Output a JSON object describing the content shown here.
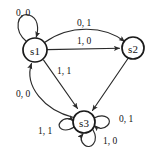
{
  "diagram": {
    "type": "finite-state-machine",
    "colors": {
      "background": "#ffffff",
      "node_stroke": "#1a1a1a",
      "node_fill": "#ffffff",
      "edge_stroke": "#2a2a2a",
      "text": "#121212"
    },
    "nodes": [
      {
        "id": "s1",
        "label": "s1",
        "cx": 35,
        "cy": 50,
        "r": 12
      },
      {
        "id": "s2",
        "label": "s2",
        "cx": 133,
        "cy": 48,
        "r": 11
      },
      {
        "id": "s3",
        "label": "s3",
        "cx": 84,
        "cy": 122,
        "r": 11
      }
    ],
    "edges": [
      {
        "id": "e1",
        "from": "s1",
        "to": "s1",
        "label": "0, 0",
        "kind": "self-loop",
        "lx": 23,
        "ly": 13
      },
      {
        "id": "e2",
        "from": "s1",
        "to": "s2",
        "label": "0, 1",
        "kind": "curved-arc",
        "lx": 84,
        "ly": 23
      },
      {
        "id": "e3",
        "from": "s1",
        "to": "s2",
        "label": "1, 0",
        "kind": "straight",
        "lx": 84,
        "ly": 41
      },
      {
        "id": "e4",
        "from": "s1",
        "to": "s3",
        "label": "1, 1",
        "kind": "straight",
        "lx": 64,
        "ly": 71
      },
      {
        "id": "e5",
        "from": "s3",
        "to": "s1",
        "label": "0, 0",
        "kind": "curved-arc",
        "lx": 23,
        "ly": 94
      },
      {
        "id": "e6",
        "from": "s2",
        "to": "s3",
        "label": "",
        "kind": "straight",
        "lx": 0,
        "ly": 0
      },
      {
        "id": "e7",
        "from": "s3",
        "to": "s3",
        "label": "1, 1",
        "kind": "self-loop",
        "lx": 45,
        "ly": 131
      },
      {
        "id": "e8",
        "from": "s3",
        "to": "s3",
        "label": "0, 1",
        "kind": "self-loop",
        "lx": 126,
        "ly": 119
      },
      {
        "id": "e9",
        "from": "s3",
        "to": "s3",
        "label": "1, 0",
        "kind": "self-loop",
        "lx": 110,
        "ly": 141
      }
    ]
  }
}
